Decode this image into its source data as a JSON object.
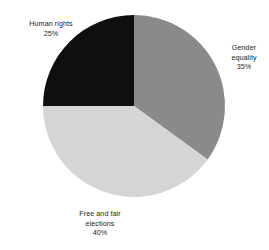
{
  "chart_data": {
    "type": "pie",
    "title": "",
    "subtitle": "",
    "xlabel": "",
    "ylabel": "",
    "grid": false,
    "legend_position": "none",
    "label_format": "name + percent",
    "start_angle_deg": 0,
    "direction": "clockwise",
    "categories": [
      "Gender equality",
      "Free and fair elections",
      "Human rights"
    ],
    "values": [
      35,
      40,
      25
    ],
    "units": "%",
    "total": 100,
    "slices": [
      {
        "name": "gender-equality",
        "label_lines": [
          "Gender",
          "equality",
          "35%"
        ],
        "label_text": "Gender equality 35%",
        "value": 35,
        "value_text": "35%",
        "color": "#8a8a8a",
        "start_deg": 0,
        "end_deg": 126
      },
      {
        "name": "free-and-fair-elections",
        "label_lines": [
          "Free and fair",
          "elections",
          "40%"
        ],
        "label_text": "Free and fair elections 40%",
        "value": 40,
        "value_text": "40%",
        "color": "#d5d5d5",
        "start_deg": 126,
        "end_deg": 270
      },
      {
        "name": "human-rights",
        "label_lines": [
          "Human rights",
          "25%"
        ],
        "label_text": "Human rights 25%",
        "value": 25,
        "value_text": "25%",
        "color": "#0f0f0f",
        "start_deg": 270,
        "end_deg": 360
      }
    ],
    "geometry": {
      "center_x": 134,
      "center_y": 106,
      "radius": 91
    },
    "colors": {
      "background": "#ffffff",
      "text": "#231f20",
      "gender_equality": "#8a8a8a",
      "free_and_fair_elections": "#d5d5d5",
      "human_rights": "#0f0f0f"
    }
  },
  "labels": {
    "human_rights": {
      "line1": "Human rights",
      "line2": "25%"
    },
    "gender_equality": {
      "line1": "Gender",
      "line2": "equality",
      "line3": "35%"
    },
    "free_and_fair_elections": {
      "line1": "Free and fair",
      "line2": "elections",
      "line3": "40%"
    }
  }
}
